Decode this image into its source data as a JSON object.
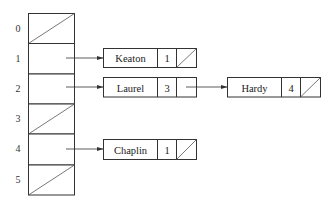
{
  "diagram": {
    "type": "hash-table-with-chaining",
    "table": {
      "slots": [
        {
          "index": "0",
          "empty": true
        },
        {
          "index": "1",
          "empty": false,
          "chain": [
            "Keaton"
          ]
        },
        {
          "index": "2",
          "empty": false,
          "chain": [
            "Laurel",
            "Hardy"
          ]
        },
        {
          "index": "3",
          "empty": true
        },
        {
          "index": "4",
          "empty": false,
          "chain": [
            "Chaplin"
          ]
        },
        {
          "index": "5",
          "empty": true
        }
      ]
    },
    "nodes": [
      {
        "id": "keaton",
        "name": "Keaton",
        "count": "1",
        "next": null
      },
      {
        "id": "laurel",
        "name": "Laurel",
        "count": "3",
        "next": "hardy"
      },
      {
        "id": "hardy",
        "name": "Hardy",
        "count": "4",
        "next": null
      },
      {
        "id": "chaplin",
        "name": "Chaplin",
        "count": "1",
        "next": null
      }
    ],
    "colors": {
      "stroke": "#333333",
      "background": "#ffffff"
    }
  }
}
